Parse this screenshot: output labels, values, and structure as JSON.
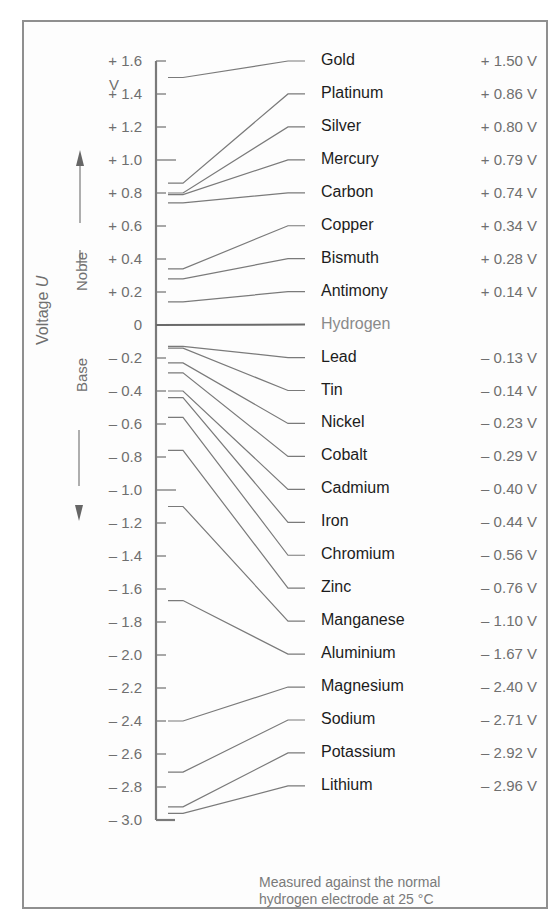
{
  "chart_data": {
    "type": "diagram",
    "axis": {
      "label": "Voltage U",
      "unit": "V",
      "range": [
        -3.0,
        1.6
      ],
      "ticks": [
        "+ 1.6",
        "+ 1.4",
        "+ 1.2",
        "+ 1.0",
        "+ 0.8",
        "+ 0.6",
        "+ 0.4",
        "+ 0.2",
        "0",
        "– 0.2",
        "– 0.4",
        "– 0.6",
        "– 0.8",
        "– 1.0",
        "– 1.2",
        "– 1.4",
        "– 1.6",
        "– 1.8",
        "– 2.0",
        "– 2.2",
        "– 2.4",
        "– 2.6",
        "– 2.8",
        "– 3.0"
      ],
      "tick_values": [
        1.6,
        1.4,
        1.2,
        1.0,
        0.8,
        0.6,
        0.4,
        0.2,
        0,
        -0.2,
        -0.4,
        -0.6,
        -0.8,
        -1.0,
        -1.2,
        -1.4,
        -1.6,
        -1.8,
        -2.0,
        -2.2,
        -2.4,
        -2.6,
        -2.8,
        -3.0
      ],
      "noble_label": "Noble",
      "base_label": "Base"
    },
    "elements": [
      {
        "name": "Gold",
        "value": 1.5,
        "label": "+ 1.50 V"
      },
      {
        "name": "Platinum",
        "value": 0.86,
        "label": "+ 0.86 V"
      },
      {
        "name": "Silver",
        "value": 0.8,
        "label": "+ 0.80 V"
      },
      {
        "name": "Mercury",
        "value": 0.79,
        "label": "+ 0.79 V"
      },
      {
        "name": "Carbon",
        "value": 0.74,
        "label": "+ 0.74 V"
      },
      {
        "name": "Copper",
        "value": 0.34,
        "label": "+ 0.34 V"
      },
      {
        "name": "Bismuth",
        "value": 0.28,
        "label": "+ 0.28 V"
      },
      {
        "name": "Antimony",
        "value": 0.14,
        "label": "+ 0.14 V"
      },
      {
        "name": "Hydrogen",
        "value": 0.0,
        "label": "",
        "reference": true
      },
      {
        "name": "Lead",
        "value": -0.13,
        "label": "– 0.13 V"
      },
      {
        "name": "Tin",
        "value": -0.14,
        "label": "– 0.14 V"
      },
      {
        "name": "Nickel",
        "value": -0.23,
        "label": "– 0.23 V"
      },
      {
        "name": "Cobalt",
        "value": -0.29,
        "label": "– 0.29 V"
      },
      {
        "name": "Cadmium",
        "value": -0.4,
        "label": "– 0.40 V"
      },
      {
        "name": "Iron",
        "value": -0.44,
        "label": "– 0.44 V"
      },
      {
        "name": "Chromium",
        "value": -0.56,
        "label": "– 0.56 V"
      },
      {
        "name": "Zinc",
        "value": -0.76,
        "label": "– 0.76 V"
      },
      {
        "name": "Manganese",
        "value": -1.1,
        "label": "– 1.10 V"
      },
      {
        "name": "Aluminium",
        "value": -1.67,
        "label": "– 1.67 V"
      },
      {
        "name": "Magnesium",
        "value": -2.4,
        "label": "– 2.40 V"
      },
      {
        "name": "Sodium",
        "value": -2.71,
        "label": "– 2.71 V"
      },
      {
        "name": "Potassium",
        "value": -2.92,
        "label": "– 2.92 V"
      },
      {
        "name": "Lithium",
        "value": -2.96,
        "label": "– 2.96 V"
      }
    ],
    "footnote": [
      "Measured against the normal",
      "hydrogen electrode at 25 °C"
    ]
  },
  "axis_title": {
    "text": "Voltage ",
    "italic": "U"
  },
  "unit_label": "V",
  "colors": {
    "line": "#7a7a7a",
    "axis": "#7a7a7a",
    "text": "#1c1c1c",
    "muted": "#6f6f6f",
    "frame": "#8f8f8f"
  }
}
